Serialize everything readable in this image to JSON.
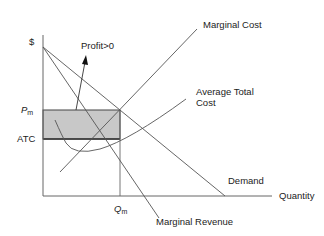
{
  "diagram": {
    "colors": {
      "line": "#555555",
      "axis": "#666666",
      "profit_fill": "#c8c8c8",
      "profit_border": "#444444",
      "text": "#222222"
    },
    "axes": {
      "y_label": "$",
      "x_label": "Quantity"
    },
    "price_labels": {
      "pm_main": "P",
      "pm_sub": "m",
      "atc": "ATC"
    },
    "quantity_label": {
      "main": "Q",
      "sub": "m"
    },
    "curves": {
      "marginal_cost": "Marginal Cost",
      "average_total_cost_line1": "Average Total",
      "average_total_cost_line2": "Cost",
      "demand": "Demand",
      "marginal_revenue": "Marginal Revenue"
    },
    "annotation": {
      "profit": "Profit>0"
    }
  }
}
